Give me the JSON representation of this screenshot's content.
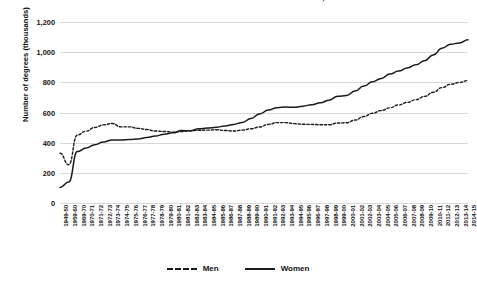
{
  "chart_data": {
    "type": "line",
    "title": "BACHELOR'S DEGREES CONFERRED BY GENDER, 1950-2015",
    "xlabel": "",
    "ylabel": "Number of degrees (thousands)",
    "ylim": [
      0,
      1200
    ],
    "yticks": [
      0,
      200,
      400,
      600,
      800,
      1000,
      1200
    ],
    "ytick_labels": [
      "0",
      "200",
      "400",
      "600",
      "800",
      "1,000",
      "1,200"
    ],
    "grid": true,
    "legend_position": "bottom-center",
    "categories": [
      "1949-50",
      "1959-60",
      "1969-70",
      "1970-71",
      "1971-72",
      "1972-73",
      "1973-74",
      "1974-75",
      "1975-76",
      "1976-77",
      "1977-78",
      "1978-79",
      "1979-80",
      "1980-81",
      "1981-82",
      "1982-83",
      "1983-84",
      "1984-85",
      "1985-86",
      "1986-87",
      "1987-88",
      "1988-89",
      "1989-90",
      "1990-91",
      "1991-92",
      "1992-93",
      "1993-94",
      "1994-95",
      "1995-96",
      "1996-97",
      "1997-98",
      "1998-99",
      "1999-00",
      "2000-01",
      "2001-02",
      "2002-03",
      "2003-04",
      "2004-05",
      "2005-06",
      "2006-07",
      "2007-08",
      "2008-09",
      "2009-10",
      "2010-11",
      "2011-12",
      "2012-13",
      "2013-14",
      "2014-15"
    ],
    "series": [
      {
        "name": "Men",
        "style": "dashed",
        "color": "#1b1b1b",
        "values": [
          330,
          254,
          451,
          476,
          501,
          518,
          527,
          505,
          505,
          495,
          487,
          477,
          474,
          470,
          473,
          479,
          482,
          483,
          486,
          481,
          477,
          483,
          492,
          504,
          521,
          533,
          533,
          526,
          522,
          521,
          519,
          519,
          530,
          532,
          550,
          573,
          595,
          613,
          631,
          650,
          667,
          685,
          707,
          734,
          765,
          787,
          799,
          812
        ]
      },
      {
        "name": "Women",
        "style": "solid",
        "color": "#1b1b1b",
        "values": [
          103,
          139,
          341,
          364,
          386,
          404,
          418,
          418,
          421,
          424,
          434,
          444,
          456,
          465,
          480,
          479,
          492,
          497,
          502,
          511,
          521,
          534,
          560,
          590,
          616,
          632,
          637,
          634,
          642,
          652,
          664,
          682,
          708,
          712,
          742,
          775,
          804,
          826,
          855,
          875,
          895,
          916,
          943,
          982,
          1026,
          1052,
          1061,
          1082
        ]
      }
    ]
  },
  "legend": {
    "entries": [
      {
        "label": "Men",
        "style": "dashed"
      },
      {
        "label": "Women",
        "style": "solid"
      }
    ]
  }
}
